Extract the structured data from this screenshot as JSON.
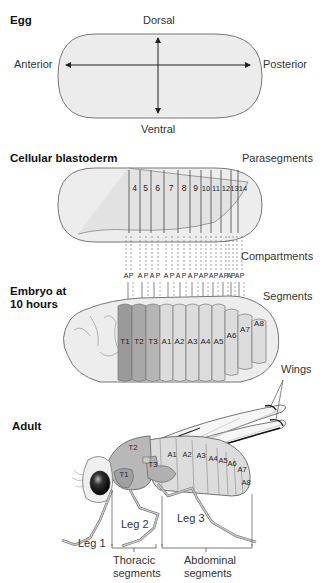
{
  "panels": {
    "egg": {
      "title": "Egg",
      "axes": {
        "dorsal": "Dorsal",
        "ventral": "Ventral",
        "anterior": "Anterior",
        "posterior": "Posterior"
      }
    },
    "blastoderm": {
      "title": "Cellular blastoderm",
      "parasegments_label": "Parasegments",
      "parasegments": [
        "4",
        "5",
        "6",
        "7",
        "8",
        "9",
        "10",
        "11",
        "12",
        "13",
        "14"
      ],
      "compartments_label": "Compartments",
      "compartments": [
        "A",
        "P",
        "A",
        "P",
        "A",
        "P",
        "A",
        "P",
        "A",
        "P",
        "A",
        "P",
        "A",
        "P",
        "A",
        "P",
        "A",
        "P",
        "A",
        "P",
        "A",
        "P"
      ]
    },
    "embryo": {
      "title_line1": "Embryo at",
      "title_line2": "10 hours",
      "segments_label": "Segments",
      "segments": [
        "T1",
        "T2",
        "T3",
        "A1",
        "A2",
        "A3",
        "A4",
        "A5",
        "A6",
        "A7",
        "A8"
      ]
    },
    "adult": {
      "title": "Adult",
      "wings_label": "Wings",
      "segments": [
        "T1",
        "T2",
        "T3",
        "A1",
        "A2",
        "A3",
        "A4",
        "A5",
        "A6",
        "A7",
        "A8"
      ],
      "legs": [
        "Leg 1",
        "Leg 2",
        "Leg 3"
      ],
      "thoracic_label_1": "Thoracic",
      "thoracic_label_2": "segments",
      "abdominal_label_1": "Abdominal",
      "abdominal_label_2": "segments"
    }
  },
  "colors": {
    "egg_fill": "#ececec",
    "thoracic_dark": "#9a9a9a",
    "thoracic_mid": "#b5b5b5",
    "abdominal": "#dcdcdc",
    "head": "#efefef",
    "outline": "#666666"
  }
}
